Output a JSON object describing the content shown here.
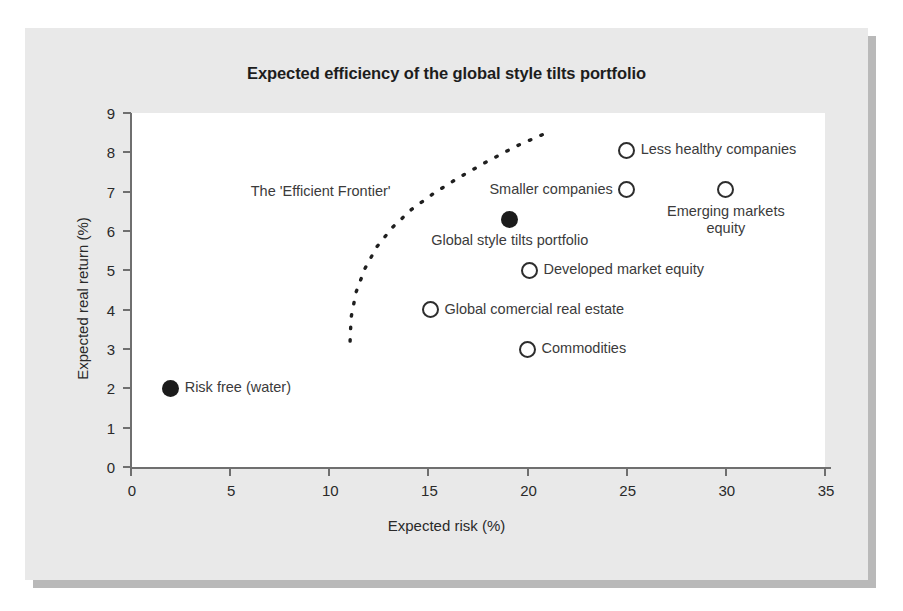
{
  "chart_data": {
    "type": "scatter",
    "title": "Expected efficiency of the global style tilts portfolio",
    "xlabel": "Expected risk (%)",
    "ylabel": "Expected real return (%)",
    "xlim": [
      0,
      35
    ],
    "ylim": [
      0,
      9
    ],
    "xticks": [
      0,
      5,
      10,
      15,
      20,
      25,
      30,
      35
    ],
    "yticks": [
      0,
      1,
      2,
      3,
      4,
      5,
      6,
      7,
      8,
      9
    ],
    "grid": false,
    "legend": "none",
    "points": [
      {
        "label": "Risk free (water)",
        "x": 2.0,
        "y": 2.0,
        "style": "filled",
        "label_pos": "right"
      },
      {
        "label": "Global comercial real estate",
        "x": 15.1,
        "y": 4.0,
        "style": "open",
        "label_pos": "right"
      },
      {
        "label": "Commodities",
        "x": 20.0,
        "y": 3.0,
        "style": "open",
        "label_pos": "right"
      },
      {
        "label": "Developed market equity",
        "x": 20.1,
        "y": 5.0,
        "style": "open",
        "label_pos": "right"
      },
      {
        "label": "Global style tilts portfolio",
        "x": 19.1,
        "y": 6.3,
        "style": "filled",
        "label_pos": "below"
      },
      {
        "label": "Smaller companies",
        "x": 25.0,
        "y": 7.05,
        "style": "open",
        "label_pos": "left"
      },
      {
        "label": "Less healthy companies",
        "x": 25.0,
        "y": 8.05,
        "style": "open",
        "label_pos": "right"
      },
      {
        "label": "Emerging markets\nequity",
        "x": 30.0,
        "y": 7.05,
        "style": "open",
        "label_pos": "below"
      }
    ],
    "annotations": [
      {
        "text": "The 'Efficient Frontier'",
        "x": 13.2,
        "y": 7.0,
        "description": "dashed concave curve rising from (11.1, 3.2) to (21.2, 8.5)"
      }
    ],
    "frontier_curve": {
      "style": "dashed",
      "color": "#1f1f1f",
      "points": [
        [
          11.05,
          3.2
        ],
        [
          11.1,
          3.8
        ],
        [
          11.35,
          4.45
        ],
        [
          11.8,
          5.05
        ],
        [
          12.4,
          5.6
        ],
        [
          13.2,
          6.1
        ],
        [
          14.15,
          6.55
        ],
        [
          15.25,
          6.95
        ],
        [
          16.5,
          7.35
        ],
        [
          17.9,
          7.75
        ],
        [
          19.4,
          8.15
        ],
        [
          21.2,
          8.55
        ]
      ]
    }
  },
  "colors": {
    "panel_background": "#e9e9e9",
    "panel_shadow": "#b9b9b9",
    "plot_background": "#ffffff",
    "axis": "#6f6f6f",
    "text": "#2a2a2a",
    "marker": "#1b1b1b"
  }
}
